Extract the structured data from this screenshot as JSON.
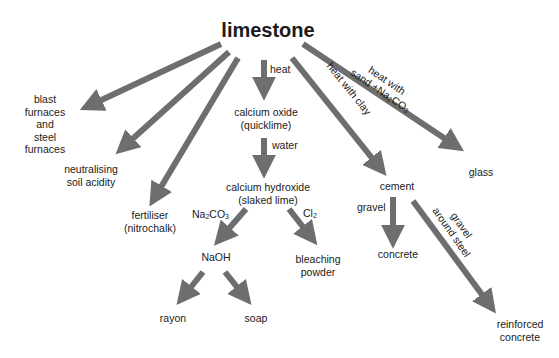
{
  "diagram": {
    "title": "limestone",
    "arrow_color": "#6e6e6e",
    "nodes": {
      "limestone": "limestone",
      "blast_furnaces": [
        "blast",
        "furnaces",
        "and",
        "steel",
        "furnaces"
      ],
      "neutralising": [
        "neutralising",
        "soil acidity"
      ],
      "fertiliser": [
        "fertiliser",
        "(nitrochalk)"
      ],
      "calcium_oxide": [
        "calcium oxide",
        "(quicklime)"
      ],
      "calcium_hydroxide": [
        "calcium hydroxide",
        "(slaked lime)"
      ],
      "naoh": "NaOH",
      "rayon": "rayon",
      "soap": "soap",
      "bleaching_powder": [
        "bleaching",
        "powder"
      ],
      "cement": "cement",
      "concrete": "concrete",
      "reinforced_concrete": [
        "reinforced",
        "concrete"
      ],
      "glass": "glass"
    },
    "conditions": {
      "heat": "heat",
      "water": "water",
      "na2co3": {
        "base": "Na",
        "sub1": "2",
        "mid": "CO",
        "sub2": "3"
      },
      "cl2": {
        "base": "Cl",
        "sub": "2"
      },
      "gravel": "gravel",
      "heat_with_clay": "heat with clay",
      "heat_with_sand_line1": "heat with",
      "heat_with_sand_line2": {
        "base": "sand +Na",
        "sub1": "2",
        "mid": "CO",
        "sub2": "3"
      },
      "gravel_around_steel_line1": "gravel",
      "gravel_around_steel_line2": "around steel"
    },
    "edges": [
      {
        "from": "limestone",
        "to": "blast furnaces and steel furnaces"
      },
      {
        "from": "limestone",
        "to": "neutralising soil acidity"
      },
      {
        "from": "limestone",
        "to": "fertiliser (nitrochalk)"
      },
      {
        "from": "limestone",
        "to": "calcium oxide (quicklime)",
        "label": "heat"
      },
      {
        "from": "limestone",
        "to": "cement",
        "label": "heat with clay"
      },
      {
        "from": "limestone",
        "to": "glass",
        "label": "heat with sand +Na2CO3"
      },
      {
        "from": "calcium oxide (quicklime)",
        "to": "calcium hydroxide (slaked lime)",
        "label": "water"
      },
      {
        "from": "calcium hydroxide (slaked lime)",
        "to": "NaOH",
        "label": "Na2CO3"
      },
      {
        "from": "calcium hydroxide (slaked lime)",
        "to": "bleaching powder",
        "label": "Cl2"
      },
      {
        "from": "NaOH",
        "to": "rayon"
      },
      {
        "from": "NaOH",
        "to": "soap"
      },
      {
        "from": "cement",
        "to": "concrete",
        "label": "gravel"
      },
      {
        "from": "cement",
        "to": "reinforced concrete",
        "label": "gravel around steel"
      }
    ]
  }
}
